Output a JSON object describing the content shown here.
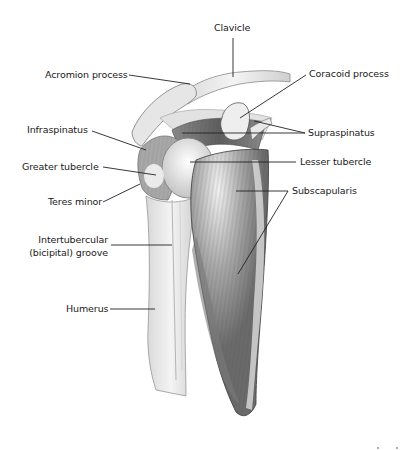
{
  "diagram": {
    "labels": {
      "clavicle": "Clavicle",
      "acromion_process": "Acromion process",
      "coracoid_process": "Coracoid process",
      "infraspinatus": "Infraspinatus",
      "supraspinatus": "Supraspinatus",
      "greater_tubercle": "Greater tubercle",
      "lesser_tubercle": "Lesser tubercle",
      "teres_minor": "Teres minor",
      "subscapularis": "Subscapularis",
      "intertubercular_line1": "Intertubercular",
      "intertubercular_line2": "(bicipital) groove",
      "humerus": "Humerus"
    },
    "colors": {
      "background": "#ffffff",
      "text": "#1a1a1a",
      "leader_line": "#222222",
      "bone_fill": "#ececec",
      "bone_shade": "#c8c8c8",
      "muscle_dark": "#6e6e6e",
      "muscle_mid": "#9a9a9a",
      "outline": "#3a3a3a"
    }
  }
}
